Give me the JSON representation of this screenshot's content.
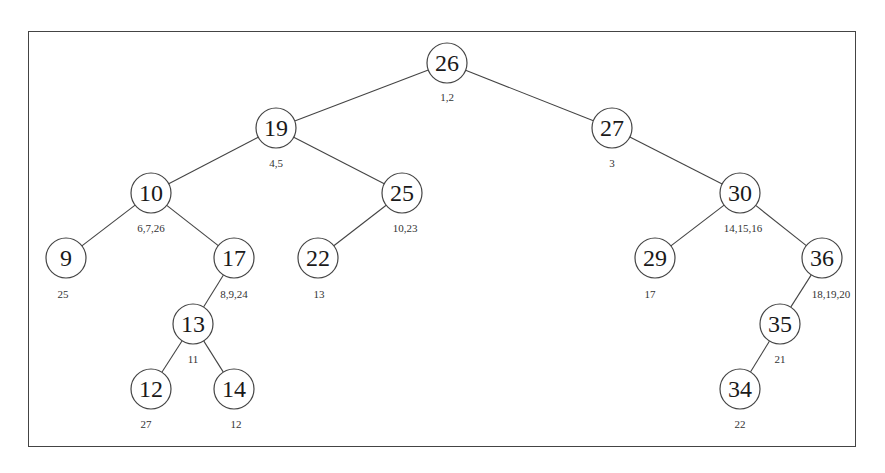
{
  "diagram": {
    "type": "binary-search-tree",
    "node_radius": 20,
    "nodes": [
      {
        "id": "n26",
        "key": "26",
        "label": "1,2",
        "x": 447,
        "y": 63,
        "lx": 447,
        "ly": 101
      },
      {
        "id": "n19",
        "key": "19",
        "label": "4,5",
        "x": 276,
        "y": 128,
        "lx": 276,
        "ly": 167
      },
      {
        "id": "n27",
        "key": "27",
        "label": "3",
        "x": 612,
        "y": 128,
        "lx": 612,
        "ly": 167
      },
      {
        "id": "n10",
        "key": "10",
        "label": "6,7,26",
        "x": 151,
        "y": 193,
        "lx": 151,
        "ly": 232
      },
      {
        "id": "n25",
        "key": "25",
        "label": "10,23",
        "x": 402,
        "y": 193,
        "lx": 405,
        "ly": 232
      },
      {
        "id": "n30",
        "key": "30",
        "label": "14,15,16",
        "x": 740,
        "y": 193,
        "lx": 743,
        "ly": 232
      },
      {
        "id": "n9",
        "key": "9",
        "label": "25",
        "x": 66,
        "y": 258,
        "lx": 63,
        "ly": 298
      },
      {
        "id": "n17",
        "key": "17",
        "label": "8,9,24",
        "x": 234,
        "y": 258,
        "lx": 234,
        "ly": 298
      },
      {
        "id": "n22",
        "key": "22",
        "label": "13",
        "x": 318,
        "y": 258,
        "lx": 319,
        "ly": 298
      },
      {
        "id": "n29",
        "key": "29",
        "label": "17",
        "x": 655,
        "y": 258,
        "lx": 650,
        "ly": 298
      },
      {
        "id": "n36",
        "key": "36",
        "label": "18,19,20",
        "x": 822,
        "y": 258,
        "lx": 831,
        "ly": 298
      },
      {
        "id": "n13",
        "key": "13",
        "label": "11",
        "x": 193,
        "y": 324,
        "lx": 193,
        "ly": 363
      },
      {
        "id": "n35",
        "key": "35",
        "label": "21",
        "x": 780,
        "y": 324,
        "lx": 780,
        "ly": 363
      },
      {
        "id": "n12",
        "key": "12",
        "label": "27",
        "x": 151,
        "y": 389,
        "lx": 146,
        "ly": 428
      },
      {
        "id": "n14",
        "key": "14",
        "label": "12",
        "x": 234,
        "y": 389,
        "lx": 236,
        "ly": 428
      },
      {
        "id": "n34",
        "key": "34",
        "label": "22",
        "x": 740,
        "y": 389,
        "lx": 740,
        "ly": 428
      }
    ],
    "edges": [
      [
        "n26",
        "n19"
      ],
      [
        "n26",
        "n27"
      ],
      [
        "n19",
        "n10"
      ],
      [
        "n19",
        "n25"
      ],
      [
        "n27",
        "n30"
      ],
      [
        "n10",
        "n9"
      ],
      [
        "n10",
        "n17"
      ],
      [
        "n25",
        "n22"
      ],
      [
        "n30",
        "n29"
      ],
      [
        "n30",
        "n36"
      ],
      [
        "n17",
        "n13"
      ],
      [
        "n36",
        "n35"
      ],
      [
        "n13",
        "n12"
      ],
      [
        "n13",
        "n14"
      ],
      [
        "n35",
        "n34"
      ]
    ]
  }
}
